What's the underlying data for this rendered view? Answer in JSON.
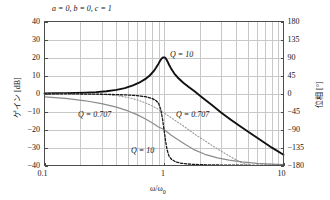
{
  "chart_data": {
    "type": "line",
    "title": "a = 0, b = 0, c = 1",
    "xlabel": "ω/ω₀",
    "ylabel": "ゲイン [dB]",
    "y2label": "位相 [°]",
    "xscale": "log",
    "xlim": [
      0.1,
      10
    ],
    "ylim": [
      -40,
      40
    ],
    "y2lim": [
      -180,
      180
    ],
    "grid": true,
    "legend_position": "inline-annotations",
    "xticks": [
      "0.1",
      "1",
      "10"
    ],
    "xtick_values": [
      0.1,
      1,
      10
    ],
    "yticks": [
      "40",
      "30",
      "20",
      "10",
      "0",
      "-10",
      "-20",
      "-30",
      "-40"
    ],
    "ytick_values": [
      40,
      30,
      20,
      10,
      0,
      -10,
      -20,
      -30,
      -40
    ],
    "y2ticks": [
      "180",
      "135",
      "90",
      "45",
      "0",
      "-45",
      "-90",
      "-135",
      "-180"
    ],
    "y2tick_values": [
      180,
      135,
      90,
      45,
      0,
      -45,
      -90,
      -135,
      -180
    ],
    "annotations": [
      {
        "text": "Q = 10",
        "x": 1.45,
        "y": 18,
        "axis": "gain"
      },
      {
        "text": "Q = 0.707",
        "x": 0.42,
        "y": -16,
        "axis": "gain"
      },
      {
        "text": "Q = 0.707",
        "x": 1.35,
        "y": -16,
        "axis": "phase"
      },
      {
        "text": "Q = 10",
        "x": 0.82,
        "y": -33,
        "axis": "phase"
      }
    ],
    "series": [
      {
        "name": "Gain Q = 10",
        "style": "solid",
        "color": "#111111",
        "width": 1.9,
        "axis": "gain",
        "peak_db": 20,
        "peak_x": 1,
        "x": [
          0.1,
          0.12,
          0.15,
          0.18,
          0.22,
          0.27,
          0.33,
          0.4,
          0.47,
          0.55,
          0.62,
          0.7,
          0.76,
          0.82,
          0.86,
          0.9,
          0.93,
          0.95,
          0.97,
          0.98,
          0.99,
          1.0,
          1.01,
          1.02,
          1.03,
          1.05,
          1.07,
          1.1,
          1.15,
          1.22,
          1.3,
          1.45,
          1.6,
          1.8,
          2.1,
          2.5,
          3.0,
          3.6,
          4.4,
          5.4,
          6.6,
          8.0,
          10.0
        ],
        "y": [
          0.09,
          0.13,
          0.21,
          0.3,
          0.47,
          0.76,
          1.23,
          2.0,
          3.0,
          4.5,
          6.0,
          8.1,
          10.0,
          12.4,
          14.4,
          16.6,
          18.3,
          19.2,
          19.8,
          20.0,
          20.0,
          20.0,
          20.0,
          19.9,
          19.6,
          18.8,
          17.8,
          16.1,
          13.7,
          11.1,
          8.9,
          6.0,
          3.8,
          1.2,
          -2.3,
          -6.3,
          -10.5,
          -14.4,
          -18.5,
          -22.5,
          -26.4,
          -30.1,
          -34.0
        ]
      },
      {
        "name": "Gain Q = 0.707",
        "style": "dotted",
        "color": "#9a9a9a",
        "width": 1.1,
        "axis": "gain",
        "x": [
          0.1,
          0.15,
          0.22,
          0.3,
          0.4,
          0.5,
          0.6,
          0.7,
          0.8,
          0.9,
          1.0,
          1.15,
          1.3,
          1.5,
          1.8,
          2.1,
          2.5,
          3.0,
          3.6,
          4.4,
          5.4,
          6.6,
          8.0,
          10.0
        ],
        "y": [
          -0.004,
          -0.02,
          -0.12,
          -0.4,
          -1.1,
          -2.2,
          -3.6,
          -5.2,
          -7.0,
          -8.9,
          -10.8,
          -13.5,
          -15.9,
          -18.7,
          -22.5,
          -25.4,
          -28.7,
          -32.0,
          -35.1,
          -38.3,
          -41.4,
          -44.3,
          -47.2,
          -51.0
        ]
      },
      {
        "name": "Phase Q = 0.707",
        "style": "solid",
        "color": "#8c8c8c",
        "width": 1.2,
        "axis": "phase",
        "x": [
          0.1,
          0.15,
          0.22,
          0.3,
          0.4,
          0.5,
          0.6,
          0.7,
          0.8,
          0.9,
          1.0,
          1.15,
          1.3,
          1.5,
          1.8,
          2.2,
          2.8,
          3.5,
          4.5,
          6.0,
          8.0,
          10.0
        ],
        "y": [
          -8.2,
          -12.3,
          -18.2,
          -25.2,
          -34.2,
          -43.6,
          -53.5,
          -63.6,
          -73.7,
          -83.7,
          -90.0,
          -104.5,
          -115.0,
          -127.0,
          -141.0,
          -152.0,
          -161.0,
          -166.5,
          -171.0,
          -174.5,
          -176.5,
          -177.5
        ]
      },
      {
        "name": "Phase Q = 10",
        "style": "dashed-dotted",
        "color": "#181818",
        "width": 1.3,
        "axis": "phase",
        "x": [
          0.1,
          0.2,
          0.3,
          0.4,
          0.5,
          0.6,
          0.7,
          0.8,
          0.86,
          0.9,
          0.94,
          0.97,
          0.99,
          1.0,
          1.01,
          1.03,
          1.06,
          1.1,
          1.15,
          1.25,
          1.4,
          1.7,
          2.1,
          2.7,
          3.5,
          4.5,
          6.0,
          8.0,
          10.0
        ],
        "y": [
          -0.6,
          -1.2,
          -1.9,
          -2.7,
          -3.8,
          -5.4,
          -7.9,
          -12.7,
          -18.0,
          -24.5,
          -40.0,
          -62.0,
          -81.0,
          -90.0,
          -99.0,
          -118.0,
          -140.0,
          -156.0,
          -164.0,
          -171.0,
          -174.5,
          -177.0,
          -178.0,
          -178.7,
          -179.1,
          -179.4,
          -179.6,
          -179.7,
          -179.8
        ]
      }
    ]
  },
  "colors": {
    "frame": "#4c4c4c",
    "grid": "#c8c8c8",
    "text": "#141414",
    "background": "#ffffff"
  }
}
